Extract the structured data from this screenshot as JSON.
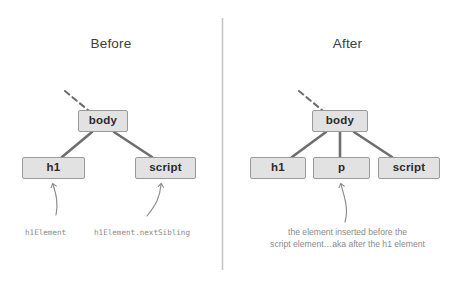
{
  "figure": {
    "background": "#ffffff",
    "node_fill": "#e2e2e2",
    "node_border": "#9a9a9a",
    "connector_color": "#6e6e6e",
    "label_color": "#8a8a8a",
    "divider_color": "#c8c8c8"
  },
  "panels": [
    {
      "id": "before",
      "title": "Before",
      "nodes": [
        {
          "id": "body",
          "label": "body"
        },
        {
          "id": "h1",
          "label": "h1"
        },
        {
          "id": "script",
          "label": "script"
        }
      ],
      "annotations": [
        {
          "id": "h1-annotation",
          "text": "h1Element"
        },
        {
          "id": "script-annotation",
          "text": "h1Element.nextSibling"
        }
      ]
    },
    {
      "id": "after",
      "title": "After",
      "nodes": [
        {
          "id": "body",
          "label": "body"
        },
        {
          "id": "h1",
          "label": "h1"
        },
        {
          "id": "p",
          "label": "p"
        },
        {
          "id": "script",
          "label": "script"
        }
      ],
      "annotations": [
        {
          "id": "p-annotation-line1",
          "text": "the element inserted before the"
        },
        {
          "id": "p-annotation-line2",
          "text": "script element…aka after the h1 element"
        }
      ]
    }
  ]
}
